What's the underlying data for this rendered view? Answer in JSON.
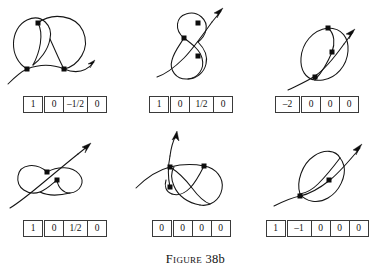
{
  "figure": {
    "caption_word": "Figure",
    "caption_number": "38b",
    "caption_full": "FIGURE 38b"
  },
  "colors": {
    "stroke": "#151515",
    "node": "#0d0d0d",
    "table_border": "#3a3a3a",
    "background": "#ffffff"
  },
  "panels": [
    {
      "id": "panel-1",
      "position": "top-left",
      "diagram_name": "double-loop-knot-diagram",
      "crossing_count": 3,
      "code": [
        "1",
        "0",
        "–1/2",
        "0"
      ]
    },
    {
      "id": "panel-2",
      "position": "top-center",
      "diagram_name": "vertical-figure-eight-knot-diagram",
      "crossing_count": 3,
      "code": [
        "1",
        "0",
        "1/2",
        "0"
      ]
    },
    {
      "id": "panel-3",
      "position": "top-right",
      "diagram_name": "lens-loop-knot-diagram",
      "crossing_count": 3,
      "code": [
        "–2",
        "0",
        "0",
        "0"
      ]
    },
    {
      "id": "panel-4",
      "position": "bottom-left",
      "diagram_name": "horizontal-figure-eight-knot-diagram",
      "crossing_count": 2,
      "code": [
        "1",
        "0",
        "1/2",
        "0"
      ]
    },
    {
      "id": "panel-5",
      "position": "bottom-center",
      "diagram_name": "trefoil-knot-diagram",
      "crossing_count": 3,
      "code": [
        "0",
        "0",
        "0",
        "0"
      ]
    },
    {
      "id": "panel-6",
      "position": "bottom-right",
      "diagram_name": "diagonal-lens-knot-diagram",
      "crossing_count": 2,
      "code": [
        "1",
        "–1",
        "0",
        "0",
        "0"
      ]
    }
  ]
}
